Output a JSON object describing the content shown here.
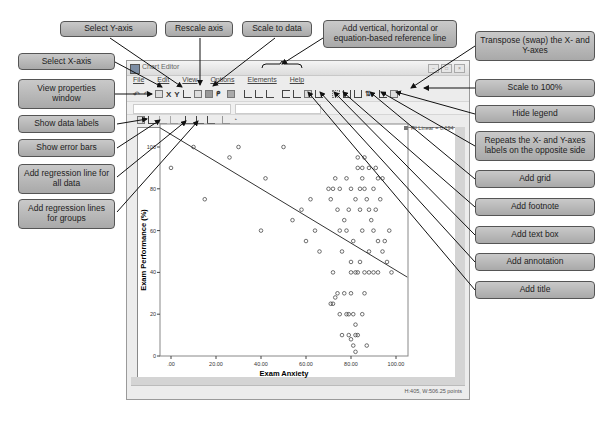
{
  "window": {
    "title": "Chart Editor",
    "menus": [
      "File",
      "Edit",
      "View",
      "Options",
      "Elements",
      "Help"
    ],
    "status_text": "H:405, W:506.25 points",
    "legend_text": "R² Linear = 0.194"
  },
  "toolbar_icons": [
    "undo-icon",
    "redo-icon",
    "properties-window-icon",
    "select-x-axis-icon",
    "select-y-axis-icon",
    "rescale-axis-icon",
    "scale-to-data-icon",
    "fill-icon",
    "brush-icon",
    "chart-icon",
    "vertical-reference-line-icon",
    "horizontal-reference-line-icon",
    "equation-reference-line-icon",
    "add-title-icon",
    "add-annotation-icon",
    "add-text-box-icon",
    "add-footnote-icon",
    "add-grid-icon",
    "opposite-axis-labels-icon",
    "hide-legend-icon",
    "transpose-icon",
    "scale-100-icon"
  ],
  "callouts": {
    "select_y": "Select Y-axis",
    "rescale": "Rescale axis",
    "scale_data": "Scale to data",
    "ref_line": "Add vertical, horizontal or equation-based reference line",
    "select_x": "Select X-axis",
    "view_props": "View properties window",
    "data_labels": "Show data labels",
    "error_bars": "Show error bars",
    "reg_all": "Add regression line for all data",
    "reg_groups": "Add regression lines for groups",
    "transpose": "Transpose (swap) the X- and Y-axes",
    "scale100": "Scale to 100%",
    "hide_legend": "Hide legend",
    "repeat_labels": "Repeats the X- and Y-axes labels on the opposite side",
    "add_grid": "Add grid",
    "add_footnote": "Add footnote",
    "add_textbox": "Add text box",
    "add_annotation": "Add annotation",
    "add_title": "Add title"
  },
  "chart_data": {
    "type": "scatter",
    "title": "",
    "xlabel": "Exam Anxiety",
    "ylabel": "Exam Performance (%)",
    "xlim": [
      -5,
      105
    ],
    "ylim": [
      0,
      105
    ],
    "xticks": [
      ".00",
      "20.00",
      "40.00",
      "60.00",
      "80.00",
      "100.00"
    ],
    "xtick_values": [
      0,
      20,
      40,
      60,
      80,
      100
    ],
    "yticks": [
      "0",
      "20",
      "40",
      "60",
      "80",
      "100"
    ],
    "ytick_values": [
      0,
      20,
      40,
      60,
      80,
      100
    ],
    "grid": false,
    "legend": "top-right",
    "regression_line": {
      "slope": -0.65,
      "intercept": 106,
      "x_range": [
        -5,
        105
      ]
    },
    "points": [
      [
        0,
        90
      ],
      [
        10,
        100
      ],
      [
        15,
        75
      ],
      [
        26,
        95
      ],
      [
        30,
        100
      ],
      [
        40,
        60
      ],
      [
        42,
        85
      ],
      [
        50,
        100
      ],
      [
        54,
        65
      ],
      [
        58,
        70
      ],
      [
        60,
        55
      ],
      [
        62,
        75
      ],
      [
        64,
        60
      ],
      [
        66,
        50
      ],
      [
        70,
        80
      ],
      [
        71,
        75
      ],
      [
        72,
        80
      ],
      [
        73,
        85
      ],
      [
        74,
        70
      ],
      [
        75,
        80
      ],
      [
        75,
        60
      ],
      [
        76,
        50
      ],
      [
        77,
        65
      ],
      [
        78,
        85
      ],
      [
        78,
        60
      ],
      [
        79,
        70
      ],
      [
        80,
        80
      ],
      [
        80,
        45
      ],
      [
        81,
        55
      ],
      [
        82,
        75
      ],
      [
        82,
        40
      ],
      [
        83,
        90
      ],
      [
        83,
        95
      ],
      [
        84,
        80
      ],
      [
        84,
        70
      ],
      [
        85,
        60
      ],
      [
        85,
        85
      ],
      [
        86,
        95
      ],
      [
        86,
        80
      ],
      [
        87,
        75
      ],
      [
        88,
        70
      ],
      [
        88,
        50
      ],
      [
        89,
        65
      ],
      [
        90,
        80
      ],
      [
        90,
        60
      ],
      [
        91,
        70
      ],
      [
        92,
        55
      ],
      [
        93,
        75
      ],
      [
        72,
        40
      ],
      [
        74,
        30
      ],
      [
        71,
        25
      ],
      [
        72,
        25
      ],
      [
        73,
        28
      ],
      [
        75,
        20
      ],
      [
        78,
        20
      ],
      [
        79,
        20
      ],
      [
        80,
        30
      ],
      [
        81,
        20
      ],
      [
        82,
        15
      ],
      [
        79,
        10
      ],
      [
        80,
        8
      ],
      [
        81,
        5
      ],
      [
        82,
        10
      ],
      [
        83,
        10
      ],
      [
        82,
        2
      ],
      [
        87,
        5
      ],
      [
        76,
        10
      ],
      [
        77,
        30
      ],
      [
        85,
        20
      ],
      [
        86,
        30
      ],
      [
        80,
        40
      ],
      [
        83,
        40
      ],
      [
        84,
        45
      ],
      [
        86,
        40
      ],
      [
        88,
        40
      ],
      [
        90,
        40
      ],
      [
        92,
        40
      ],
      [
        94,
        50
      ],
      [
        96,
        45
      ],
      [
        98,
        40
      ],
      [
        95,
        55
      ],
      [
        97,
        60
      ],
      [
        92,
        85
      ],
      [
        91,
        90
      ],
      [
        94,
        85
      ],
      [
        88,
        90
      ],
      [
        85,
        90
      ]
    ]
  }
}
